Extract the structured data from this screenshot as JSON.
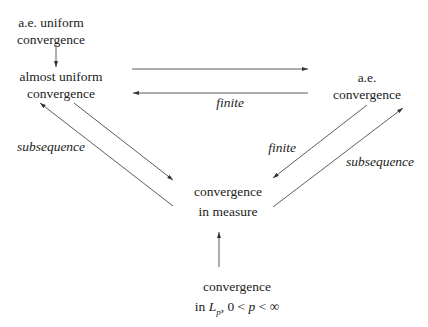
{
  "nodes": {
    "ae_uniform": {
      "line1": "a.e. uniform",
      "line2": "convergence"
    },
    "almost_uniform": {
      "line1": "almost uniform",
      "line2": "convergence"
    },
    "ae": {
      "line1": "a.e.",
      "line2": "convergence"
    },
    "measure": {
      "line1": "convergence",
      "line2": "in measure"
    },
    "lp": {
      "line1": "convergence",
      "line2_prefix": "in ",
      "line2_L": "L",
      "line2_sub": "p",
      "line2_rest": ", 0 < ",
      "line2_p": "p",
      "line2_end": " < ∞"
    }
  },
  "edge_labels": {
    "ae_to_almost": "finite",
    "measure_to_almost": "subsequence",
    "ae_to_measure": "finite",
    "measure_to_ae": "subsequence"
  },
  "colors": {
    "line": "#333333",
    "text": "#222222"
  }
}
